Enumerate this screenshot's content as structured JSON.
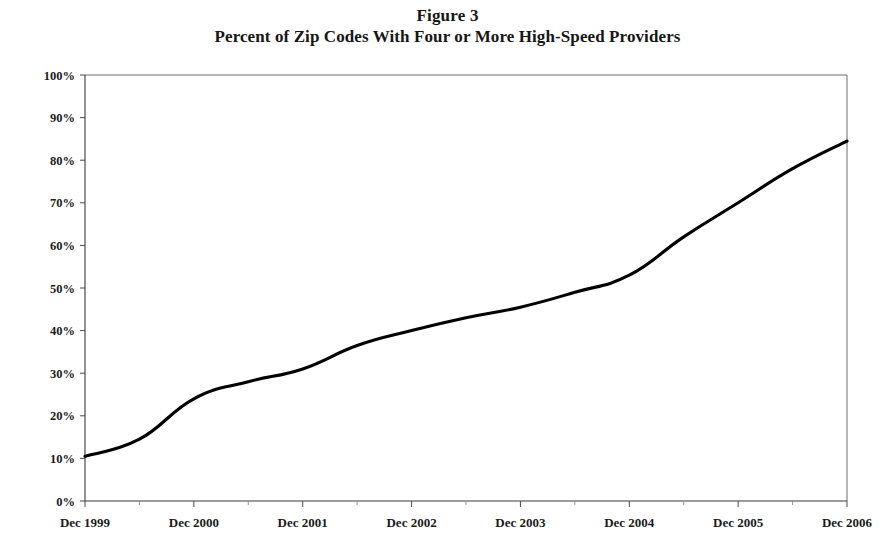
{
  "figure": {
    "title": "Figure 3",
    "subtitle": "Percent of Zip Codes With Four or More High-Speed Providers"
  },
  "chart_data": {
    "type": "line",
    "title": "Figure 3",
    "subtitle": "Percent of Zip Codes With Four or More High-Speed Providers",
    "xlabel": "",
    "ylabel": "",
    "ylim": [
      0,
      100
    ],
    "ytick_labels": [
      "0%",
      "10%",
      "20%",
      "30%",
      "40%",
      "50%",
      "60%",
      "70%",
      "80%",
      "90%",
      "100%"
    ],
    "ytick_values": [
      0,
      10,
      20,
      30,
      40,
      50,
      60,
      70,
      80,
      90,
      100
    ],
    "xtick_labels": [
      "Dec 1999",
      "Dec 2000",
      "Dec 2001",
      "Dec 2002",
      "Dec 2003",
      "Dec 2004",
      "Dec 2005",
      "Dec 2006"
    ],
    "grid": false,
    "legend": false,
    "legend_position": "none",
    "line_color": "#000000",
    "x": [
      "Dec 1999",
      "Jun 2000",
      "Dec 2000",
      "Jun 2001",
      "Dec 2001",
      "Jun 2002",
      "Dec 2002",
      "Jun 2003",
      "Dec 2003",
      "Jun 2004",
      "Dec 2004",
      "Jun 2005",
      "Dec 2005",
      "Jun 2006",
      "Dec 2006"
    ],
    "values": [
      10.5,
      14.5,
      24.0,
      28.0,
      31.0,
      36.5,
      40.0,
      43.0,
      45.5,
      49.0,
      53.0,
      62.0,
      70.0,
      78.0,
      84.5
    ],
    "series": [
      {
        "name": "Percent of zip codes with four or more high-speed providers",
        "values": [
          10.5,
          14.5,
          24.0,
          28.0,
          31.0,
          36.5,
          40.0,
          43.0,
          45.5,
          49.0,
          53.0,
          62.0,
          70.0,
          78.0,
          84.5
        ]
      }
    ]
  },
  "axes": {
    "y_ticks": [
      {
        "label": "100%",
        "value": 100
      },
      {
        "label": "90%",
        "value": 90
      },
      {
        "label": "80%",
        "value": 80
      },
      {
        "label": "70%",
        "value": 70
      },
      {
        "label": "60%",
        "value": 60
      },
      {
        "label": "50%",
        "value": 50
      },
      {
        "label": "40%",
        "value": 40
      },
      {
        "label": "30%",
        "value": 30
      },
      {
        "label": "20%",
        "value": 20
      },
      {
        "label": "10%",
        "value": 10
      },
      {
        "label": "0%",
        "value": 0
      }
    ],
    "x_ticks": [
      {
        "label": "Dec 1999",
        "index": 0
      },
      {
        "label": "Dec 2000",
        "index": 2
      },
      {
        "label": "Dec 2001",
        "index": 4
      },
      {
        "label": "Dec 2002",
        "index": 6
      },
      {
        "label": "Dec 2003",
        "index": 8
      },
      {
        "label": "Dec 2004",
        "index": 10
      },
      {
        "label": "Dec 2005",
        "index": 12
      },
      {
        "label": "Dec 2006",
        "index": 14
      }
    ]
  }
}
